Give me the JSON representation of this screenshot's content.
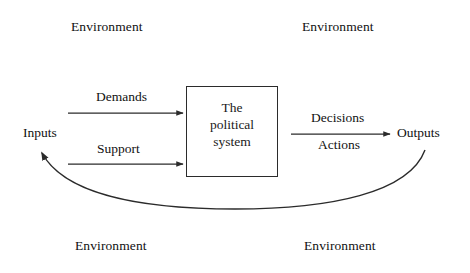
{
  "diagram": {
    "stroke_color": "#2b2b2b",
    "text_color": "#111111",
    "background_color": "#ffffff",
    "environment_labels": {
      "top_left": "Environment",
      "top_right": "Environment",
      "bottom_left": "Environment",
      "bottom_right": "Environment"
    },
    "terminals": {
      "inputs": "Inputs",
      "outputs": "Outputs"
    },
    "input_flows": [
      {
        "label": "Demands"
      },
      {
        "label": "Support"
      }
    ],
    "output_flows": [
      {
        "label": "Decisions"
      },
      {
        "label": "Actions"
      }
    ],
    "system_box": {
      "line1": "The",
      "line2": "political",
      "line3": "system"
    },
    "feedback_loop": {
      "from": "Outputs",
      "to": "Inputs"
    }
  }
}
